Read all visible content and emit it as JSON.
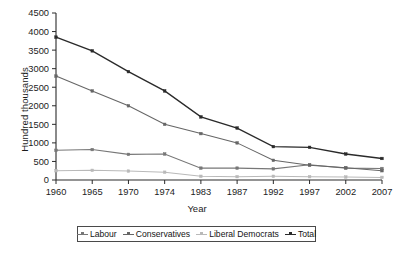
{
  "chart_data": {
    "type": "line",
    "title": "",
    "xlabel": "Year",
    "ylabel": "Hundred thousands",
    "categories": [
      "1960",
      "1965",
      "1970",
      "1974",
      "1983",
      "1987",
      "1992",
      "1997",
      "2002",
      "2007"
    ],
    "x": [
      1960,
      1965,
      1970,
      1974,
      1983,
      1987,
      1992,
      1997,
      2002,
      2007
    ],
    "ylim": [
      0,
      4500
    ],
    "xlim": [
      1960,
      2007
    ],
    "yticks": [
      0,
      500,
      1000,
      1500,
      2000,
      2500,
      3000,
      3500,
      4000,
      4500
    ],
    "ytick_labels": [
      "0",
      "500",
      "1000",
      "1500",
      "2000",
      "2500",
      "3000",
      "3500",
      "4000",
      "4500"
    ],
    "grid": false,
    "legend_position": "bottom",
    "series": [
      {
        "name": "Labour",
        "color": "#777777",
        "marker": "square",
        "values": [
          800,
          820,
          690,
          700,
          320,
          320,
          300,
          410,
          320,
          310
        ]
      },
      {
        "name": "Conservatives",
        "color": "#666666",
        "marker": "square",
        "values": [
          2800,
          2400,
          2000,
          1500,
          1250,
          1000,
          530,
          400,
          330,
          250
        ]
      },
      {
        "name": "Liberal Democrats",
        "color": "#b9b9b9",
        "marker": "square",
        "values": [
          250,
          260,
          240,
          210,
          100,
          90,
          100,
          90,
          80,
          70
        ]
      },
      {
        "name": "Total",
        "color": "#2a2a2a",
        "marker": "square",
        "values": [
          3850,
          3480,
          2920,
          2400,
          1700,
          1400,
          900,
          880,
          700,
          580
        ]
      }
    ]
  },
  "axes": {
    "y_title": "Hundred thousands",
    "x_title": "Year"
  },
  "legend": {
    "items": [
      {
        "label": "Labour",
        "color": "#777777"
      },
      {
        "label": "Conservatives",
        "color": "#666666"
      },
      {
        "label": "Liberal Democrats",
        "color": "#b9b9b9"
      },
      {
        "label": "Total",
        "color": "#2a2a2a"
      }
    ]
  }
}
